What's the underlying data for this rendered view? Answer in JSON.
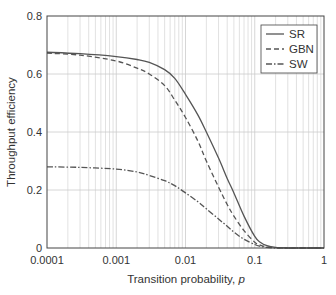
{
  "chart_data": {
    "type": "line",
    "title": "",
    "xlabel": "Transition probability, ",
    "xlabel_italic": "p",
    "ylabel": "Throughput efficiency",
    "xscale": "log",
    "xlim": [
      0.0001,
      1
    ],
    "ylim": [
      0,
      0.8
    ],
    "x_ticks": [
      0.0001,
      0.001,
      0.01,
      0.1,
      1
    ],
    "x_tick_labels": [
      "0.0001",
      "0.001",
      "0.01",
      "0.1",
      "1"
    ],
    "y_ticks": [
      0,
      0.2,
      0.4,
      0.6,
      0.8
    ],
    "y_tick_labels": [
      "0",
      "0.2",
      "0.4",
      "0.6",
      "0.8"
    ],
    "grid": true,
    "legend_position": "upper right",
    "x": [
      0.0001,
      0.0003,
      0.001,
      0.002,
      0.003,
      0.005,
      0.007,
      0.01,
      0.015,
      0.02,
      0.03,
      0.04,
      0.05,
      0.07,
      0.1,
      0.12,
      0.15,
      0.2,
      0.3,
      0.5,
      1
    ],
    "series": [
      {
        "name": "SR",
        "style": "solid",
        "values": [
          0.675,
          0.67,
          0.66,
          0.65,
          0.64,
          0.615,
          0.585,
          0.53,
          0.46,
          0.4,
          0.31,
          0.24,
          0.19,
          0.11,
          0.04,
          0.02,
          0.008,
          0.002,
          0.0,
          0.0,
          0.0
        ]
      },
      {
        "name": "GBN",
        "style": "dashed",
        "values": [
          0.672,
          0.665,
          0.645,
          0.62,
          0.6,
          0.56,
          0.51,
          0.45,
          0.37,
          0.3,
          0.21,
          0.15,
          0.11,
          0.06,
          0.02,
          0.01,
          0.004,
          0.001,
          0.0,
          0.0,
          0.0
        ]
      },
      {
        "name": "SW",
        "style": "dash-dot",
        "values": [
          0.28,
          0.278,
          0.272,
          0.262,
          0.25,
          0.232,
          0.215,
          0.19,
          0.16,
          0.135,
          0.1,
          0.075,
          0.055,
          0.03,
          0.012,
          0.006,
          0.002,
          0.0,
          0.0,
          0.0,
          0.0
        ]
      }
    ]
  },
  "legend": {
    "items": [
      {
        "label": "SR",
        "dash": ""
      },
      {
        "label": "GBN",
        "dash": "5,3"
      },
      {
        "label": "SW",
        "dash": "6,2,1.5,2"
      }
    ]
  },
  "colors": {
    "line": "#555555",
    "grid": "#cccccc",
    "axis": "#444444",
    "text": "#333333"
  }
}
